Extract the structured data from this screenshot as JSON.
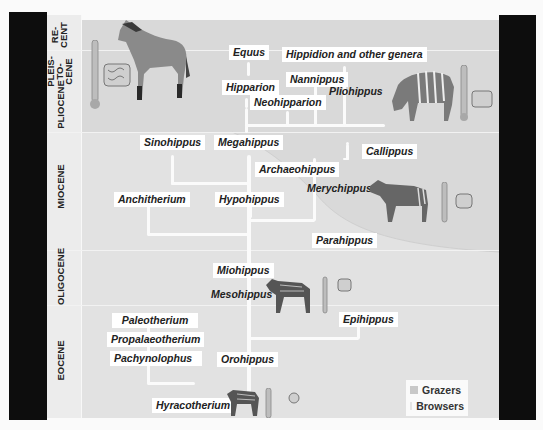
{
  "epochs": [
    {
      "id": "recent",
      "label_lines": [
        "RE-",
        "CENT"
      ]
    },
    {
      "id": "pleistocene",
      "label_lines": [
        "PLEIS-",
        "TO-",
        "CENE"
      ]
    },
    {
      "id": "pliocene",
      "label": "PLIOCENE"
    },
    {
      "id": "miocene",
      "label": "MIOCENE"
    },
    {
      "id": "oligocene",
      "label": "OLIGOCENE"
    },
    {
      "id": "eocene",
      "label": "EOCENE"
    }
  ],
  "genera": {
    "equus": "Equus",
    "hippidion": "Hippidion and other genera",
    "nannippus": "Nannippus",
    "hipparion": "Hipparion",
    "neohipparion": "Neohipparion",
    "pliohippus": "Pliohippus",
    "sinohippus": "Sinohippus",
    "megahippus": "Megahippus",
    "archaeohippus": "Archaeohippus",
    "callippus": "Callippus",
    "merychippus": "Merychippus",
    "anchitherium": "Anchitherium",
    "hypohippus": "Hypohippus",
    "parahippus": "Parahippus",
    "miohippus": "Miohippus",
    "mesohippus": "Mesohippus",
    "epihippus": "Epihippus",
    "paleotherium": "Paleotherium",
    "propalaeotherium": "Propalaeotherium",
    "pachynolophus": "Pachynolophus",
    "orohippus": "Orohippus",
    "hyracotherium": "Hyracotherium"
  },
  "legend": {
    "items": [
      {
        "label": "Grazers",
        "color": "#c8c8c8"
      },
      {
        "label": "Browsers",
        "color": "#e4e4e4"
      }
    ]
  },
  "colors": {
    "panel": "#e2e2e2",
    "grazer_zone": "#d8d8d8",
    "lines": "#fbfbfb",
    "frame": "#0d0d0d"
  }
}
